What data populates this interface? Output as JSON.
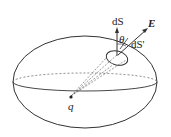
{
  "diagram": {
    "labels": {
      "dS": "dS",
      "dS_prime": "dS'",
      "E": "E",
      "theta": "θ",
      "q": "q"
    },
    "colors": {
      "stroke": "#333333",
      "background": "#ffffff"
    }
  }
}
